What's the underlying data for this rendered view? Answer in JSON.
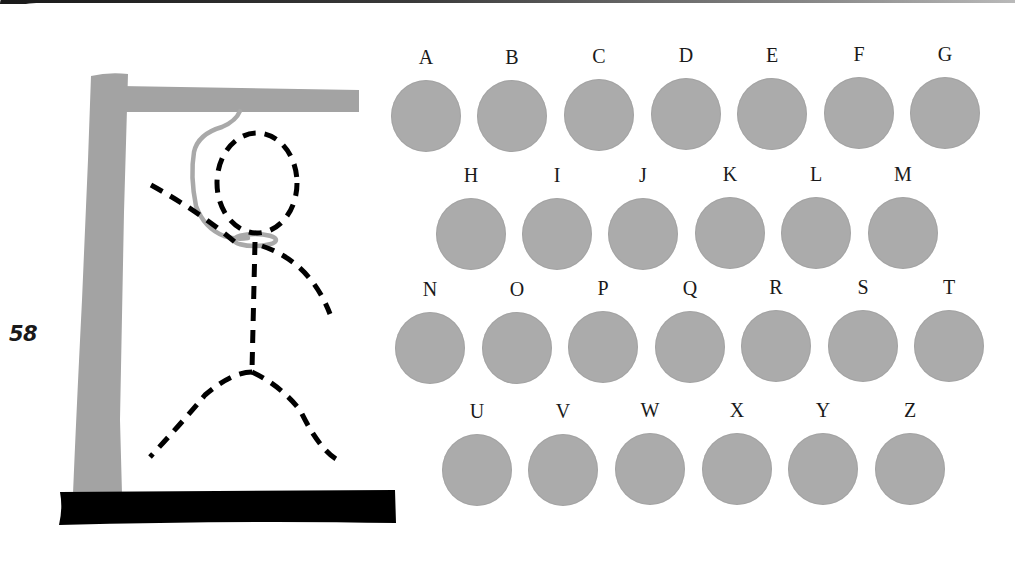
{
  "page": {
    "number": "58"
  },
  "colors": {
    "circle_fill": "#ababab",
    "gallows_gray": "#a3a3a3",
    "base_black": "#000000",
    "figure_black": "#000000",
    "rope_gray": "#a9a9a9"
  },
  "icons": {
    "gallows": "gallows-icon",
    "stick_figure": "dashed-stick-figure-icon",
    "noose": "noose-icon"
  },
  "keyboard": {
    "rows": [
      [
        "A",
        "B",
        "C",
        "D",
        "E",
        "F",
        "G"
      ],
      [
        "H",
        "I",
        "J",
        "K",
        "L",
        "M"
      ],
      [
        "N",
        "O",
        "P",
        "Q",
        "R",
        "S",
        "T"
      ],
      [
        "U",
        "V",
        "W",
        "X",
        "Y",
        "Z"
      ]
    ],
    "letters": {
      "A": "A",
      "B": "B",
      "C": "C",
      "D": "D",
      "E": "E",
      "F": "F",
      "G": "G",
      "H": "H",
      "I": "I",
      "J": "J",
      "K": "K",
      "L": "L",
      "M": "M",
      "N": "N",
      "O": "O",
      "P": "P",
      "Q": "Q",
      "R": "R",
      "S": "S",
      "T": "T",
      "U": "U",
      "V": "V",
      "W": "W",
      "X": "X",
      "Y": "Y",
      "Z": "Z"
    }
  }
}
